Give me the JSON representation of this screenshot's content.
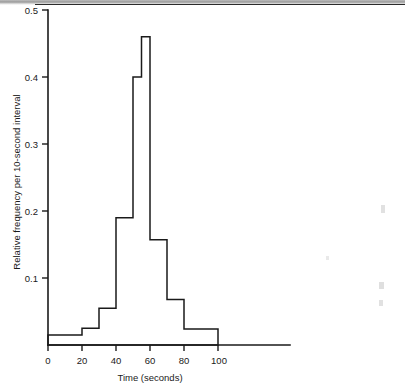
{
  "figure": {
    "background_color": "#ffffff",
    "ink_color": "#1a1a1a"
  },
  "chart_data": {
    "type": "bar",
    "title": "",
    "subtitle": "",
    "xlabel": "Time (seconds)",
    "ylabel": "Relative frequency per 10-second interval",
    "xlim": [
      0,
      140
    ],
    "ylim": [
      0,
      0.5
    ],
    "grid": false,
    "legend": null,
    "x_tick_labels": [
      "0",
      "20",
      "40",
      "60",
      "80",
      "100"
    ],
    "x_tick_values": [
      0,
      20,
      40,
      60,
      80,
      100
    ],
    "y_tick_labels": [
      "0.1",
      "0.2",
      "0.3",
      "0.4",
      "0.5"
    ],
    "y_tick_values": [
      0.1,
      0.2,
      0.3,
      0.4,
      0.5
    ],
    "bin_edges": [
      0,
      20,
      30,
      40,
      50,
      55,
      60,
      70,
      80,
      100
    ],
    "categories": [
      "0-20",
      "20-30",
      "30-40",
      "40-50",
      "50-55",
      "55-60",
      "60-70",
      "70-80",
      "80-100"
    ],
    "values": [
      0.015,
      0.025,
      0.055,
      0.19,
      0.4,
      0.46,
      0.157,
      0.068,
      0.024
    ],
    "bars": [
      {
        "from": 0,
        "to": 20,
        "height": 0.015
      },
      {
        "from": 20,
        "to": 30,
        "height": 0.025
      },
      {
        "from": 30,
        "to": 40,
        "height": 0.055
      },
      {
        "from": 40,
        "to": 50,
        "height": 0.19
      },
      {
        "from": 50,
        "to": 55,
        "height": 0.4
      },
      {
        "from": 55,
        "to": 60,
        "height": 0.46
      },
      {
        "from": 60,
        "to": 70,
        "height": 0.157
      },
      {
        "from": 70,
        "to": 80,
        "height": 0.068
      },
      {
        "from": 80,
        "to": 100,
        "height": 0.024
      }
    ],
    "annotations": []
  },
  "axis_labels": {
    "x_title": "Time (seconds)",
    "y_title": "Relative frequency per 10-second interval",
    "x_0": "0",
    "x_20": "20",
    "x_40": "40",
    "x_60": "60",
    "x_80": "80",
    "x_100": "100",
    "y_01": "0.1",
    "y_02": "0.2",
    "y_03": "0.3",
    "y_04": "0.4",
    "y_05": "0.5"
  }
}
